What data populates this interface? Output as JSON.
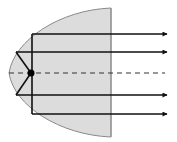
{
  "diagram": {
    "colors": {
      "reflector_fill": "#dcdcdc",
      "reflector_stroke": "#8a8a8a",
      "ray": "#111111",
      "axis": "#333333",
      "focus": "#000000",
      "background": "#ffffff"
    },
    "reflector": {
      "vertex": [
        9,
        73
      ],
      "top": [
        111,
        8
      ],
      "bottom": [
        111,
        137
      ]
    },
    "focus": {
      "x": 31,
      "y": 73,
      "r": 3.5
    },
    "axis": {
      "y": 73,
      "x1": 9,
      "x2": 165
    },
    "rays": [
      {
        "name": "ray-outer-top",
        "y": 34,
        "reflect_x": 32
      },
      {
        "name": "ray-inner-top",
        "y": 52,
        "reflect_x": 16
      },
      {
        "name": "ray-inner-bottom",
        "y": 95,
        "reflect_x": 16
      },
      {
        "name": "ray-outer-bottom",
        "y": 114,
        "reflect_x": 32
      }
    ],
    "arrow_tip_x": 167
  }
}
